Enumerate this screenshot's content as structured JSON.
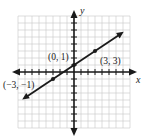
{
  "chart_data": {
    "type": "line",
    "title": "",
    "xlabel": "x",
    "ylabel": "y",
    "xlim": [
      -8,
      8
    ],
    "ylim": [
      -8,
      8
    ],
    "grid": true,
    "legend": null,
    "series": [
      {
        "name": "line through (-3,-1), (0,1), (3,3)",
        "equation": "y = (2/3)x + 1",
        "x": [
          -3,
          0,
          3
        ],
        "y": [
          -1,
          1,
          3
        ],
        "arrows_both_ends": true
      }
    ],
    "annotations": [
      {
        "text": "(0, 1)",
        "x": 0,
        "y": 1
      },
      {
        "text": "(3, 3)",
        "x": 3,
        "y": 3
      },
      {
        "text": "(−3, −1)",
        "x": -3,
        "y": -1
      }
    ]
  },
  "labels": {
    "x_axis": "x",
    "y_axis": "y",
    "p1": "(0, 1)",
    "p2": "(3, 3)",
    "p3": "(−3, −1)"
  },
  "colors": {
    "grid": "#c8c8c8",
    "axis": "#1a1a1a",
    "line": "#1a1a1a"
  }
}
